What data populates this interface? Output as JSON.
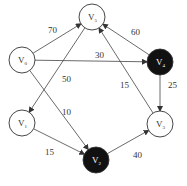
{
  "diagram": {
    "type": "weighted-directed-graph",
    "top_fragment": "",
    "nodes": [
      {
        "id": "V0",
        "base": "V",
        "sub": "0",
        "x": 22,
        "y": 60,
        "fill": "#ffffff",
        "text": "#333333"
      },
      {
        "id": "V5",
        "base": "V",
        "sub": "5",
        "x": 92,
        "y": 17,
        "fill": "#ffffff",
        "text": "#333333"
      },
      {
        "id": "V4",
        "base": "V",
        "sub": "4",
        "x": 160,
        "y": 62,
        "fill": "#111111",
        "text": "#ffffff"
      },
      {
        "id": "V1",
        "base": "V",
        "sub": "1",
        "x": 22,
        "y": 123,
        "fill": "#ffffff",
        "text": "#333333"
      },
      {
        "id": "V3",
        "base": "V",
        "sub": "3",
        "x": 160,
        "y": 124,
        "fill": "#ffffff",
        "text": "#333333"
      },
      {
        "id": "V2",
        "base": "V",
        "sub": "2",
        "x": 96,
        "y": 160,
        "fill": "#111111",
        "text": "#ffffff"
      }
    ],
    "edges": [
      {
        "from": "V0",
        "to": "V5",
        "weight": "70",
        "lx": 48,
        "ly": 33
      },
      {
        "from": "V0",
        "to": "V4",
        "weight": "30",
        "lx": 95,
        "ly": 58
      },
      {
        "from": "V5",
        "to": "V1",
        "weight": "50",
        "lx": 62,
        "ly": 82
      },
      {
        "from": "V0",
        "to": "V2",
        "weight": "10",
        "lx": 62,
        "ly": 115
      },
      {
        "from": "V4",
        "to": "V5",
        "weight": "60",
        "lx": 131,
        "ly": 35
      },
      {
        "from": "V3",
        "to": "V5",
        "weight": "15",
        "lx": 120,
        "ly": 88
      },
      {
        "from": "V4",
        "to": "V3",
        "weight": "25",
        "lx": 168,
        "ly": 88
      },
      {
        "from": "V1",
        "to": "V2",
        "weight": "15",
        "lx": 45,
        "ly": 155
      },
      {
        "from": "V2",
        "to": "V3",
        "weight": "40",
        "lx": 133,
        "ly": 158
      }
    ]
  }
}
